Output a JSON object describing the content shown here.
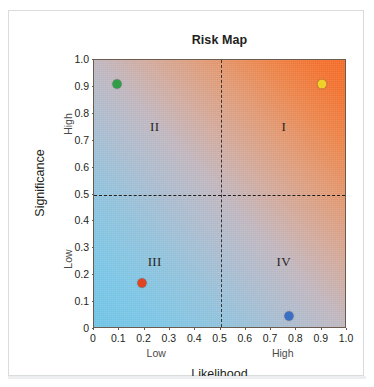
{
  "chart_data": {
    "type": "scatter",
    "title": "Risk Map",
    "xlabel": "Likelihood",
    "ylabel": "Significance",
    "xlim": [
      0,
      1.0
    ],
    "ylim": [
      0,
      1.0
    ],
    "grid": false,
    "legend": "none",
    "xticks": [
      "0",
      "0.1",
      "0.2",
      "0.3",
      "0.4",
      "0.5",
      "0.6",
      "0.7",
      "0.8",
      "0.9",
      "1.0"
    ],
    "xtick_values": [
      0,
      0.1,
      0.2,
      0.3,
      0.4,
      0.5,
      0.6,
      0.7,
      0.8,
      0.9,
      1.0
    ],
    "yticks": [
      "0",
      "0.1",
      "0.2",
      "0.3",
      "0.4",
      "0.5",
      "0.6",
      "0.7",
      "0.8",
      "0.9",
      "1.0"
    ],
    "ytick_values": [
      0,
      0.1,
      0.2,
      0.3,
      0.4,
      0.5,
      0.6,
      0.7,
      0.8,
      0.9,
      1.0
    ],
    "x_axis_captions": [
      {
        "label": "Low",
        "at": 0.25
      },
      {
        "label": "High",
        "at": 0.75
      }
    ],
    "y_axis_captions": [
      {
        "label": "Low",
        "at": 0.25
      },
      {
        "label": "High",
        "at": 0.75
      }
    ],
    "reference_lines": [
      {
        "orientation": "vertical",
        "value": 0.5,
        "style": "dashed",
        "color": "#3a3330"
      },
      {
        "orientation": "horizontal",
        "value": 0.5,
        "style": "dashed",
        "color": "#1f1c1a"
      }
    ],
    "quadrants": [
      {
        "name": "I",
        "label": "I",
        "x": 0.75,
        "y": 0.75,
        "meaning": "high likelihood, high significance"
      },
      {
        "name": "II",
        "label": "II",
        "x": 0.24,
        "y": 0.75,
        "meaning": "low likelihood, high significance"
      },
      {
        "name": "III",
        "label": "III",
        "x": 0.24,
        "y": 0.25,
        "meaning": "low likelihood, low significance"
      },
      {
        "name": "IV",
        "label": "IV",
        "x": 0.75,
        "y": 0.25,
        "meaning": "high likelihood, low significance"
      }
    ],
    "points": [
      {
        "name": "green-point",
        "x": 0.09,
        "y": 0.91,
        "color": "#2f9e46",
        "quadrant": "II"
      },
      {
        "name": "yellow-point",
        "x": 0.9,
        "y": 0.91,
        "color": "#f0d12c",
        "quadrant": "I"
      },
      {
        "name": "red-point",
        "x": 0.19,
        "y": 0.17,
        "color": "#e04322",
        "quadrant": "III"
      },
      {
        "name": "blue-point",
        "x": 0.77,
        "y": 0.05,
        "color": "#3b6fc4",
        "quadrant": "IV"
      }
    ],
    "background_gradient": {
      "direction": "bottom-left to top-right",
      "low_risk_color": "#6ec4e8",
      "mid_risk_color": "#c0b7c0",
      "high_risk_color": "#f66a26"
    }
  }
}
